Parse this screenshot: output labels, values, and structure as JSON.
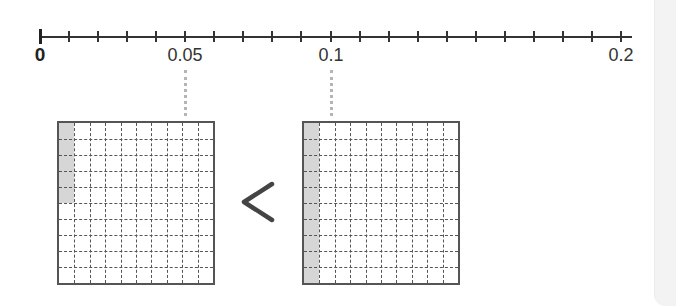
{
  "number_line": {
    "min": 0,
    "max": 0.2,
    "tick_step": 0.01,
    "tick_count": 21,
    "labels": [
      {
        "value": 0,
        "text": "0"
      },
      {
        "value": 0.05,
        "text": "0.05"
      },
      {
        "value": 0.1,
        "text": "0.1"
      },
      {
        "value": 0.2,
        "text": "0.2"
      }
    ]
  },
  "comparison": {
    "left": {
      "value": 0.05,
      "label": "0.05",
      "grid_rows": 10,
      "grid_cols": 10,
      "shaded_cells": 5
    },
    "symbol": "<",
    "symbol_name": "less-than",
    "right": {
      "value": 0.1,
      "label": "0.1",
      "grid_rows": 10,
      "grid_cols": 10,
      "shaded_cells": 10
    }
  },
  "colors": {
    "shade": "#d6d6d6",
    "grid_line": "#555555",
    "axis": "#333333",
    "connector": "#b5b5b5",
    "symbol": "#444444"
  }
}
